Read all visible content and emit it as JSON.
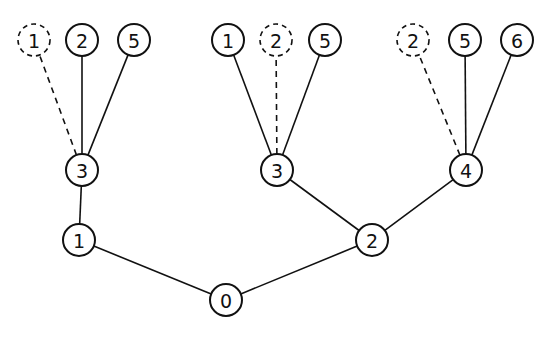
{
  "diagram": {
    "type": "tree",
    "nodes": [
      {
        "id": "root",
        "label": "0",
        "style": "solid"
      },
      {
        "id": "n1",
        "label": "1",
        "style": "solid"
      },
      {
        "id": "n2",
        "label": "2",
        "style": "solid"
      },
      {
        "id": "n1_3",
        "label": "3",
        "style": "solid"
      },
      {
        "id": "n2_3",
        "label": "3",
        "style": "solid"
      },
      {
        "id": "n2_4",
        "label": "4",
        "style": "solid"
      },
      {
        "id": "a1",
        "label": "1",
        "style": "dashed"
      },
      {
        "id": "a2",
        "label": "2",
        "style": "solid"
      },
      {
        "id": "a5",
        "label": "5",
        "style": "solid"
      },
      {
        "id": "b1",
        "label": "1",
        "style": "solid"
      },
      {
        "id": "b2",
        "label": "2",
        "style": "dashed"
      },
      {
        "id": "b5",
        "label": "5",
        "style": "solid"
      },
      {
        "id": "c2",
        "label": "2",
        "style": "dashed"
      },
      {
        "id": "c5",
        "label": "5",
        "style": "solid"
      },
      {
        "id": "c6",
        "label": "6",
        "style": "solid"
      }
    ],
    "edges": [
      {
        "from": "root",
        "to": "n1",
        "style": "solid"
      },
      {
        "from": "root",
        "to": "n2",
        "style": "solid"
      },
      {
        "from": "n1",
        "to": "n1_3",
        "style": "solid"
      },
      {
        "from": "n2",
        "to": "n2_3",
        "style": "solid"
      },
      {
        "from": "n2",
        "to": "n2_4",
        "style": "solid"
      },
      {
        "from": "n1_3",
        "to": "a1",
        "style": "dashed"
      },
      {
        "from": "n1_3",
        "to": "a2",
        "style": "solid"
      },
      {
        "from": "n1_3",
        "to": "a5",
        "style": "solid"
      },
      {
        "from": "n2_3",
        "to": "b1",
        "style": "solid"
      },
      {
        "from": "n2_3",
        "to": "b2",
        "style": "dashed"
      },
      {
        "from": "n2_3",
        "to": "b5",
        "style": "solid"
      },
      {
        "from": "n2_4",
        "to": "c2",
        "style": "dashed"
      },
      {
        "from": "n2_4",
        "to": "c5",
        "style": "solid"
      },
      {
        "from": "n2_4",
        "to": "c6",
        "style": "solid"
      }
    ]
  }
}
